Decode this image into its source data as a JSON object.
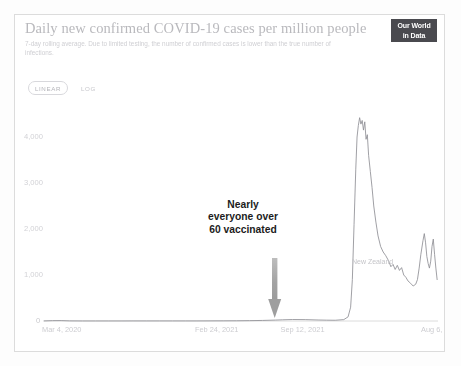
{
  "chart_header": {
    "title": "Daily new confirmed COVID-19 cases per million people",
    "subtitle": "7-day rolling average. Due to limited testing, the number of confirmed cases is lower than the true number of infections.",
    "logo_line1": "Our World",
    "logo_line2": "in Data"
  },
  "controls": {
    "scale_linear": "LINEAR",
    "scale_log": "LOG",
    "scale_selected": "LINEAR"
  },
  "annotation": {
    "text": "Nearly everyone over 60 vaccinated",
    "line1": "Nearly",
    "line2": "everyone over",
    "line3": "60 vaccinated",
    "arrow_color": "#9a9a9a",
    "text_color": "#1c1c1c"
  },
  "colors": {
    "series_line": "#8f8f95",
    "axis": "#dcdcdc",
    "tick_text": "#d2d2d6",
    "title_text": "#b9b9bd",
    "logo_bg": "#4a4a4f",
    "frame_border": "#dcdcdc",
    "background": "#ffffff"
  },
  "chart_data": {
    "type": "line",
    "title": "Daily new confirmed COVID-19 cases per million people",
    "subtitle": "7-day rolling average. Due to limited testing, the number of confirmed cases is lower than the true number of infections.",
    "xlabel": "",
    "ylabel": "",
    "yscale": "linear",
    "ylim": [
      0,
      4500
    ],
    "grid": false,
    "legend": "inline-right",
    "y_ticks": [
      0,
      1000,
      2000,
      3000,
      4000
    ],
    "y_tick_labels": [
      "0",
      "1,000",
      "2,000",
      "3,000",
      "4,000"
    ],
    "x_tick_labels": [
      "Mar 4, 2020",
      "Feb 24, 2021",
      "Sep 12, 2021",
      "Aug 6, 2022"
    ],
    "x_tick_positions": [
      0,
      357,
      557,
      885
    ],
    "x_range_days": [
      0,
      920
    ],
    "series": [
      {
        "name": "New Zealand",
        "color": "#8f8f95",
        "points": [
          [
            0,
            2
          ],
          [
            20,
            8
          ],
          [
            40,
            9
          ],
          [
            60,
            3
          ],
          [
            90,
            1
          ],
          [
            120,
            1
          ],
          [
            150,
            1
          ],
          [
            180,
            1
          ],
          [
            210,
            2
          ],
          [
            240,
            2
          ],
          [
            270,
            2
          ],
          [
            300,
            2
          ],
          [
            330,
            2
          ],
          [
            357,
            2
          ],
          [
            390,
            3
          ],
          [
            420,
            4
          ],
          [
            450,
            5
          ],
          [
            480,
            8
          ],
          [
            510,
            12
          ],
          [
            540,
            20
          ],
          [
            557,
            26
          ],
          [
            580,
            32
          ],
          [
            610,
            30
          ],
          [
            640,
            22
          ],
          [
            660,
            18
          ],
          [
            680,
            16
          ],
          [
            700,
            30
          ],
          [
            710,
            90
          ],
          [
            716,
            300
          ],
          [
            720,
            900
          ],
          [
            724,
            2100
          ],
          [
            728,
            3300
          ],
          [
            731,
            4000
          ],
          [
            734,
            4250
          ],
          [
            737,
            4420
          ],
          [
            740,
            4280
          ],
          [
            743,
            4360
          ],
          [
            746,
            4150
          ],
          [
            749,
            4330
          ],
          [
            752,
            3950
          ],
          [
            755,
            4050
          ],
          [
            758,
            3600
          ],
          [
            762,
            3250
          ],
          [
            766,
            2900
          ],
          [
            770,
            2500
          ],
          [
            775,
            2150
          ],
          [
            780,
            1850
          ],
          [
            786,
            1620
          ],
          [
            792,
            1500
          ],
          [
            798,
            1420
          ],
          [
            804,
            1320
          ],
          [
            810,
            1180
          ],
          [
            815,
            1230
          ],
          [
            820,
            1120
          ],
          [
            825,
            1210
          ],
          [
            830,
            1100
          ],
          [
            835,
            1160
          ],
          [
            840,
            1000
          ],
          [
            845,
            950
          ],
          [
            850,
            870
          ],
          [
            856,
            820
          ],
          [
            862,
            760
          ],
          [
            868,
            800
          ],
          [
            872,
            900
          ],
          [
            876,
            1150
          ],
          [
            880,
            1450
          ],
          [
            885,
            1750
          ],
          [
            888,
            1900
          ],
          [
            891,
            1700
          ],
          [
            894,
            1400
          ],
          [
            897,
            1250
          ],
          [
            900,
            1150
          ],
          [
            903,
            1300
          ],
          [
            906,
            1620
          ],
          [
            909,
            1780
          ],
          [
            912,
            1450
          ],
          [
            915,
            1150
          ],
          [
            918,
            900
          ]
        ],
        "peak_value": 4420,
        "peak_label": "Aug 6, 2022 region",
        "secondary_peak_value": 1900
      }
    ],
    "annotations": [
      {
        "text": "Nearly everyone over 60 vaccinated",
        "arrow": "down",
        "x_tick_near": "Sep 12, 2021"
      }
    ]
  }
}
